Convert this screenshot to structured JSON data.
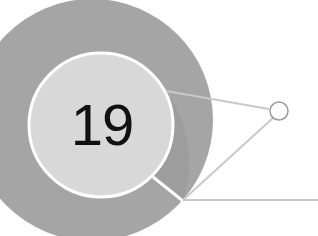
{
  "diagram": {
    "number": "19",
    "colors": {
      "background": "#ffffff",
      "outer_ring": "#a5a5a5",
      "outer_ring_segment": "#9a9a9a",
      "inner_circle": "#d8d8d8",
      "inner_border": "#ffffff",
      "connector": "#c9c9c9",
      "node_stroke": "#9a9a9a",
      "text": "#111111"
    }
  }
}
